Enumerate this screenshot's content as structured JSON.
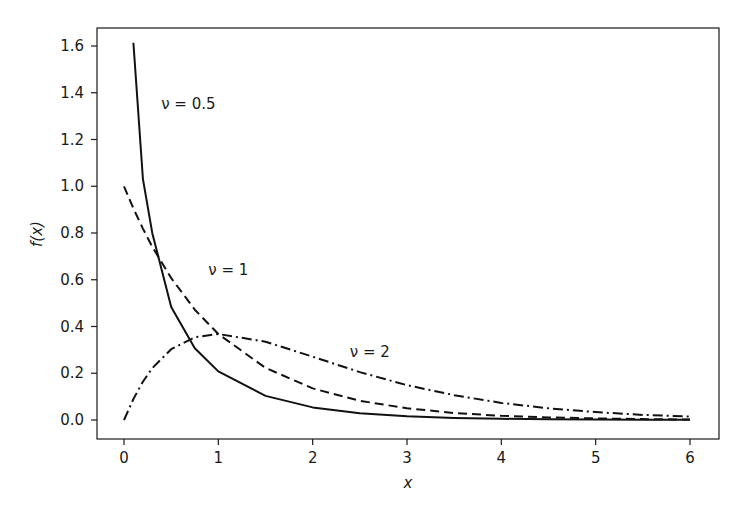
{
  "chart_data": {
    "type": "line",
    "title": "",
    "xlabel": "x",
    "ylabel": "f(x)",
    "xlim": [
      -0.3,
      6.3
    ],
    "ylim": [
      -0.08,
      1.68
    ],
    "xticks": [
      0,
      1,
      2,
      3,
      4,
      5,
      6
    ],
    "xtick_labels": [
      "0",
      "1",
      "2",
      "3",
      "4",
      "5",
      "6"
    ],
    "yticks": [
      0.0,
      0.2,
      0.4,
      0.6,
      0.8,
      1.0,
      1.2,
      1.4,
      1.6
    ],
    "ytick_labels": [
      "0.0",
      "0.2",
      "0.4",
      "0.6",
      "0.8",
      "1.0",
      "1.2",
      "1.4",
      "1.6"
    ],
    "grid": false,
    "legend": null,
    "series": [
      {
        "name": "ν = 0.5",
        "style": "solid",
        "x": [
          0.1,
          0.2,
          0.3,
          0.5,
          0.75,
          1.0,
          1.5,
          2.0,
          2.5,
          3.0,
          3.5,
          4.0,
          4.5,
          5.0,
          5.5,
          6.0
        ],
        "y": [
          1.614,
          1.032,
          0.799,
          0.484,
          0.307,
          0.208,
          0.103,
          0.054,
          0.029,
          0.016,
          0.009,
          0.005,
          0.003,
          0.002,
          0.001,
          0.001
        ]
      },
      {
        "name": "ν = 1",
        "style": "dashed",
        "x": [
          0.0,
          0.1,
          0.2,
          0.3,
          0.5,
          0.75,
          1.0,
          1.5,
          2.0,
          2.5,
          3.0,
          3.5,
          4.0,
          4.5,
          5.0,
          5.5,
          6.0
        ],
        "y": [
          1.0,
          0.905,
          0.819,
          0.741,
          0.607,
          0.472,
          0.368,
          0.223,
          0.135,
          0.082,
          0.05,
          0.03,
          0.018,
          0.011,
          0.007,
          0.004,
          0.002
        ]
      },
      {
        "name": "ν = 2",
        "style": "dashdot",
        "x": [
          0.0,
          0.1,
          0.2,
          0.3,
          0.5,
          0.75,
          1.0,
          1.5,
          2.0,
          2.5,
          3.0,
          3.5,
          4.0,
          4.5,
          5.0,
          5.5,
          6.0
        ],
        "y": [
          0.0,
          0.09,
          0.164,
          0.222,
          0.303,
          0.354,
          0.368,
          0.335,
          0.271,
          0.205,
          0.149,
          0.106,
          0.073,
          0.05,
          0.034,
          0.022,
          0.015
        ]
      }
    ],
    "annotations": [
      {
        "text": "ν = 0.5",
        "x": 0.5,
        "y": 1.33
      },
      {
        "text": "ν = 1",
        "x": 1.0,
        "y": 0.62
      },
      {
        "text": "ν = 2",
        "x": 2.5,
        "y": 0.27
      }
    ]
  }
}
